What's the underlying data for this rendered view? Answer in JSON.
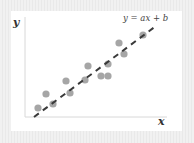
{
  "diagram": {
    "equation_label": "y = ax + b",
    "x_axis_label": "x",
    "y_axis_label": "y",
    "colors": {
      "background": "#efefef",
      "panel": "#ffffff",
      "points": "#a6a6a6",
      "line": "#3a3a3a",
      "axes": "#d8d8d8"
    }
  },
  "chart_data": {
    "type": "scatter",
    "title": "",
    "xlabel": "x",
    "ylabel": "y",
    "annotation": "y = ax + b",
    "grid": false,
    "points_px": [
      [
        38,
        108
      ],
      [
        46,
        94
      ],
      [
        53,
        104
      ],
      [
        66,
        81
      ],
      [
        70,
        93
      ],
      [
        85,
        80
      ],
      [
        88,
        66
      ],
      [
        101,
        76
      ],
      [
        108,
        76
      ],
      [
        108,
        64
      ],
      [
        119,
        43
      ],
      [
        124,
        54
      ],
      [
        143,
        35
      ]
    ],
    "fit_line_px": {
      "start": [
        34,
        117
      ],
      "end": [
        156,
        26
      ],
      "style": "dashed"
    }
  }
}
